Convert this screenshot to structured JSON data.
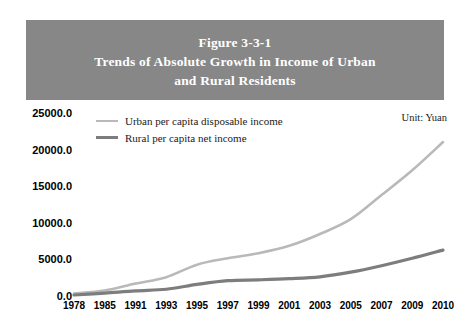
{
  "figure": {
    "title_lines": [
      "Figure 3-3-1",
      "Trends of Absolute Growth in Income of Urban",
      "and Rural Residents"
    ],
    "unit_note": "Unit: Yuan",
    "band_color": "#878787"
  },
  "legend": {
    "position": "top-left",
    "items": [
      {
        "label": "Urban per capita disposable income",
        "color": "#b9b9b9",
        "width": 2
      },
      {
        "label": "Rural per capita net income",
        "color": "#7d7d7d",
        "width": 3
      }
    ]
  },
  "chart_data": {
    "type": "line",
    "title": "Trends of Absolute Growth in Income of Urban and Rural Residents",
    "subtitle": "Figure 3-3-1",
    "xlabel": "",
    "ylabel": "",
    "unit": "Yuan",
    "grid": false,
    "legend_position": "top-left",
    "ylim": [
      0,
      25000
    ],
    "yticks": [
      0,
      5000,
      10000,
      15000,
      20000,
      25000
    ],
    "ytick_labels": [
      "0.0",
      "5000.0",
      "10000.0",
      "15000.0",
      "20000.0",
      "25000.0"
    ],
    "categories": [
      "1978",
      "1985",
      "1991",
      "1993",
      "1995",
      "1997",
      "1999",
      "2001",
      "2003",
      "2005",
      "2007",
      "2009",
      "2010"
    ],
    "series": [
      {
        "name": "Urban per capita disposable income",
        "color": "#b9b9b9",
        "values": [
          343,
          739,
          1700,
          2577,
          4283,
          5160,
          5854,
          6860,
          8472,
          10493,
          13786,
          17175,
          21033
        ]
      },
      {
        "name": "Rural per capita net income",
        "color": "#7d7d7d",
        "values": [
          134,
          398,
          709,
          922,
          1578,
          2090,
          2210,
          2366,
          2622,
          3255,
          4140,
          5153,
          6272
        ]
      }
    ]
  }
}
